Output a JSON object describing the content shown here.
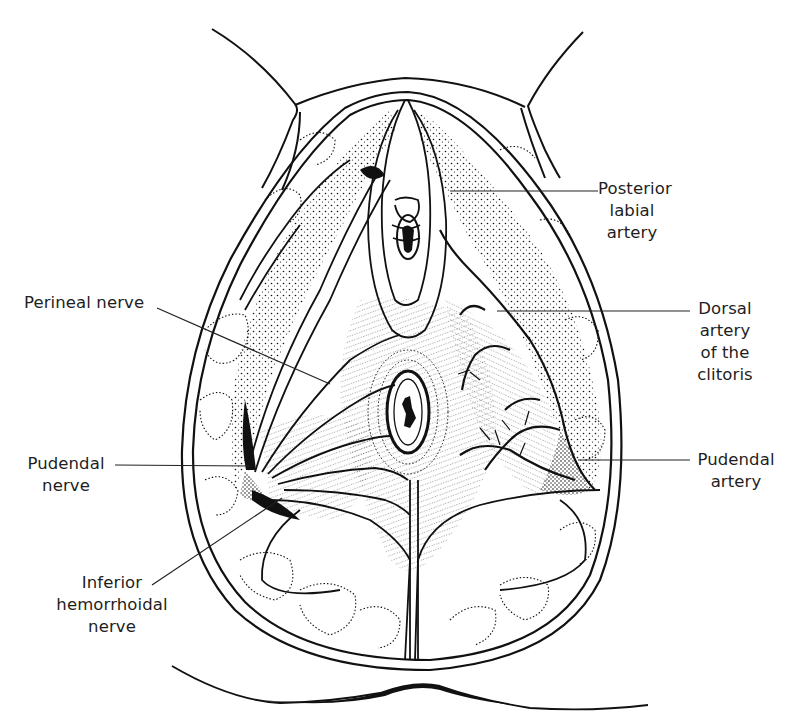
{
  "figure": {
    "type": "anatomical line drawing"
  },
  "labels": {
    "posterior_labial_artery": {
      "lines": [
        "Posterior",
        "labial",
        "artery"
      ]
    },
    "dorsal_artery_clitoris": {
      "lines": [
        "Dorsal",
        "artery",
        "of the",
        "clitoris"
      ]
    },
    "pudendal_artery": {
      "lines": [
        "Pudendal",
        "artery"
      ]
    },
    "perineal_nerve": {
      "lines": [
        "Perineal nerve"
      ]
    },
    "pudendal_nerve": {
      "lines": [
        "Pudendal",
        "nerve"
      ]
    },
    "inferior_hemorrhoidal_nerve": {
      "lines": [
        "Inferior",
        "hemorrhoidal",
        "nerve"
      ]
    }
  },
  "colors": {
    "ink": "#111111",
    "paper": "#ffffff"
  }
}
